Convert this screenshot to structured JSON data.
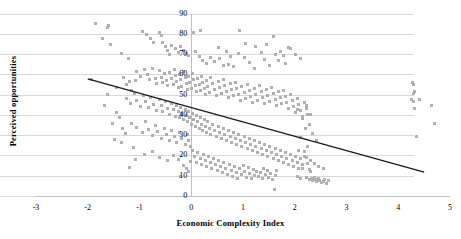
{
  "chart_data": {
    "type": "scatter",
    "title": "",
    "xlabel": "Economic Complexity Index",
    "ylabel": "Perceived opportunities",
    "xlim": [
      -3,
      5
    ],
    "ylim": [
      0,
      90
    ],
    "xticks": [
      "-3",
      "-2",
      "-1",
      "0",
      "1",
      "2",
      "3",
      "4",
      "5"
    ],
    "xtick_values": [
      -3,
      -2,
      -1,
      0,
      1,
      2,
      3,
      4,
      5
    ],
    "yticks": [
      "0",
      "10",
      "20",
      "30",
      "40",
      "50",
      "60",
      "70",
      "80",
      "90"
    ],
    "ytick_values": [
      0,
      10,
      20,
      30,
      40,
      50,
      60,
      70,
      80,
      90
    ],
    "grid": "horizontal",
    "legend": "none",
    "marker": {
      "shape": "square",
      "color": "#b0b0b0",
      "size_px": 3
    },
    "trendline": {
      "type": "linear",
      "color": "#1a1a1a",
      "width_px": 1.4,
      "x_start": -2.0,
      "y_start": 58.0,
      "x_end": 4.5,
      "y_end": 12.0
    },
    "points": [
      [
        -1.85,
        85.0
      ],
      [
        -1.6,
        84.0
      ],
      [
        -1.62,
        83.0
      ],
      [
        -1.72,
        77.5
      ],
      [
        -1.56,
        74.5
      ],
      [
        -1.35,
        70.5
      ],
      [
        -1.22,
        68.0
      ],
      [
        -0.95,
        81.0
      ],
      [
        -0.86,
        79.5
      ],
      [
        -0.78,
        77.5
      ],
      [
        -0.72,
        75.5
      ],
      [
        -0.62,
        80.5
      ],
      [
        -0.58,
        79.0
      ],
      [
        -0.55,
        75.5
      ],
      [
        -0.5,
        73.5
      ],
      [
        -0.45,
        72.0
      ],
      [
        -0.42,
        70.0
      ],
      [
        -0.38,
        74.0
      ],
      [
        -0.3,
        72.5
      ],
      [
        -0.25,
        71.0
      ],
      [
        -0.2,
        73.5
      ],
      [
        -0.15,
        72.0
      ],
      [
        -0.1,
        70.5
      ],
      [
        -0.05,
        69.5
      ],
      [
        0.05,
        80.5
      ],
      [
        0.18,
        81.5
      ],
      [
        0.08,
        71.5
      ],
      [
        0.15,
        69.0
      ],
      [
        0.22,
        67.0
      ],
      [
        0.3,
        65.5
      ],
      [
        0.45,
        66.5
      ],
      [
        0.55,
        68.0
      ],
      [
        0.62,
        64.5
      ],
      [
        0.72,
        65.0
      ],
      [
        0.82,
        64.0
      ],
      [
        0.93,
        81.5
      ],
      [
        0.92,
        70.5
      ],
      [
        1.02,
        68.5
      ],
      [
        1.12,
        66.0
      ],
      [
        1.22,
        63.0
      ],
      [
        1.35,
        71.0
      ],
      [
        1.42,
        67.5
      ],
      [
        1.52,
        64.5
      ],
      [
        1.58,
        78.5
      ],
      [
        1.62,
        70.0
      ],
      [
        1.68,
        67.0
      ],
      [
        1.72,
        71.5
      ],
      [
        1.78,
        69.5
      ],
      [
        1.82,
        65.5
      ],
      [
        1.88,
        73.0
      ],
      [
        -1.3,
        58.5
      ],
      [
        -1.2,
        56.5
      ],
      [
        -1.05,
        61.5
      ],
      [
        -0.98,
        59.0
      ],
      [
        -0.9,
        62.5
      ],
      [
        -0.85,
        60.0
      ],
      [
        -0.8,
        57.5
      ],
      [
        -0.75,
        63.0
      ],
      [
        -0.7,
        58.0
      ],
      [
        -0.68,
        55.5
      ],
      [
        -0.62,
        62.0
      ],
      [
        -0.58,
        58.5
      ],
      [
        -0.55,
        56.0
      ],
      [
        -0.52,
        60.5
      ],
      [
        -0.48,
        57.0
      ],
      [
        -0.45,
        54.5
      ],
      [
        -0.42,
        61.0
      ],
      [
        -0.38,
        58.0
      ],
      [
        -0.35,
        55.0
      ],
      [
        -0.32,
        62.5
      ],
      [
        -0.3,
        59.5
      ],
      [
        -0.28,
        56.5
      ],
      [
        -0.25,
        53.5
      ],
      [
        -0.22,
        60.0
      ],
      [
        -0.2,
        57.5
      ],
      [
        -0.18,
        54.0
      ],
      [
        -0.15,
        61.5
      ],
      [
        -0.12,
        58.5
      ],
      [
        -0.1,
        55.5
      ],
      [
        -0.08,
        52.5
      ],
      [
        -0.05,
        59.0
      ],
      [
        -0.03,
        56.0
      ],
      [
        0.0,
        53.0
      ],
      [
        0.02,
        60.5
      ],
      [
        0.05,
        57.5
      ],
      [
        0.08,
        54.5
      ],
      [
        0.1,
        51.5
      ],
      [
        0.12,
        58.0
      ],
      [
        0.15,
        55.0
      ],
      [
        0.18,
        52.0
      ],
      [
        0.2,
        59.0
      ],
      [
        0.22,
        56.0
      ],
      [
        0.25,
        53.0
      ],
      [
        0.28,
        50.0
      ],
      [
        0.3,
        57.0
      ],
      [
        0.32,
        54.0
      ],
      [
        0.35,
        51.0
      ],
      [
        0.38,
        58.5
      ],
      [
        0.42,
        55.5
      ],
      [
        0.45,
        52.5
      ],
      [
        0.48,
        49.5
      ],
      [
        0.52,
        56.5
      ],
      [
        0.55,
        53.5
      ],
      [
        0.58,
        50.5
      ],
      [
        0.62,
        57.5
      ],
      [
        0.65,
        54.5
      ],
      [
        0.68,
        51.5
      ],
      [
        0.72,
        48.5
      ],
      [
        0.75,
        55.5
      ],
      [
        0.78,
        52.5
      ],
      [
        0.82,
        49.5
      ],
      [
        0.85,
        56.0
      ],
      [
        0.88,
        53.0
      ],
      [
        0.92,
        50.0
      ],
      [
        0.95,
        47.0
      ],
      [
        0.98,
        54.0
      ],
      [
        1.02,
        51.0
      ],
      [
        1.05,
        48.0
      ],
      [
        1.08,
        55.0
      ],
      [
        1.12,
        52.0
      ],
      [
        1.15,
        49.0
      ],
      [
        1.18,
        46.0
      ],
      [
        1.22,
        53.0
      ],
      [
        1.25,
        50.0
      ],
      [
        1.28,
        47.0
      ],
      [
        1.32,
        54.5
      ],
      [
        1.35,
        51.5
      ],
      [
        1.38,
        48.5
      ],
      [
        1.42,
        45.5
      ],
      [
        1.45,
        52.5
      ],
      [
        1.48,
        49.5
      ],
      [
        1.52,
        46.5
      ],
      [
        1.55,
        53.5
      ],
      [
        1.58,
        50.5
      ],
      [
        1.62,
        47.5
      ],
      [
        1.65,
        44.5
      ],
      [
        1.68,
        51.5
      ],
      [
        1.72,
        48.5
      ],
      [
        1.75,
        45.5
      ],
      [
        1.78,
        52.0
      ],
      [
        1.82,
        49.0
      ],
      [
        1.85,
        46.0
      ],
      [
        1.88,
        43.0
      ],
      [
        1.92,
        50.0
      ],
      [
        1.95,
        47.0
      ],
      [
        1.98,
        44.0
      ],
      [
        2.02,
        41.0
      ],
      [
        2.05,
        48.0
      ],
      [
        2.08,
        45.0
      ],
      [
        2.12,
        42.0
      ],
      [
        2.15,
        39.0
      ],
      [
        2.18,
        46.0
      ],
      [
        2.22,
        43.0
      ],
      [
        2.25,
        40.0
      ],
      [
        -1.25,
        48.0
      ],
      [
        -1.18,
        45.5
      ],
      [
        -1.1,
        50.5
      ],
      [
        -1.05,
        47.0
      ],
      [
        -0.98,
        44.0
      ],
      [
        -0.92,
        49.5
      ],
      [
        -0.88,
        46.5
      ],
      [
        -0.82,
        43.5
      ],
      [
        -0.78,
        48.5
      ],
      [
        -0.72,
        45.0
      ],
      [
        -0.68,
        42.0
      ],
      [
        -0.62,
        47.5
      ],
      [
        -0.58,
        44.5
      ],
      [
        -0.55,
        41.5
      ],
      [
        -0.5,
        46.5
      ],
      [
        -0.45,
        43.0
      ],
      [
        -0.42,
        40.0
      ],
      [
        -0.38,
        45.5
      ],
      [
        -0.35,
        42.5
      ],
      [
        -0.3,
        39.0
      ],
      [
        -0.28,
        44.5
      ],
      [
        -0.25,
        41.5
      ],
      [
        -0.22,
        38.5
      ],
      [
        -0.2,
        43.5
      ],
      [
        -0.18,
        40.5
      ],
      [
        -0.15,
        37.5
      ],
      [
        -0.12,
        42.5
      ],
      [
        -0.1,
        39.5
      ],
      [
        -0.08,
        36.5
      ],
      [
        -0.05,
        41.5
      ],
      [
        -0.03,
        38.5
      ],
      [
        0.0,
        35.5
      ],
      [
        0.02,
        40.5
      ],
      [
        0.05,
        37.5
      ],
      [
        0.08,
        34.5
      ],
      [
        0.1,
        39.5
      ],
      [
        0.12,
        36.5
      ],
      [
        0.15,
        33.5
      ],
      [
        0.18,
        38.5
      ],
      [
        0.2,
        35.5
      ],
      [
        0.22,
        32.5
      ],
      [
        0.25,
        37.5
      ],
      [
        0.28,
        34.5
      ],
      [
        0.3,
        31.5
      ],
      [
        0.32,
        36.5
      ],
      [
        0.35,
        33.5
      ],
      [
        0.38,
        30.5
      ],
      [
        0.42,
        35.5
      ],
      [
        0.45,
        32.5
      ],
      [
        0.48,
        29.5
      ],
      [
        0.52,
        34.5
      ],
      [
        0.55,
        31.5
      ],
      [
        0.58,
        28.5
      ],
      [
        0.62,
        33.5
      ],
      [
        0.65,
        30.5
      ],
      [
        0.68,
        27.5
      ],
      [
        0.72,
        32.5
      ],
      [
        0.75,
        29.5
      ],
      [
        0.78,
        26.5
      ],
      [
        0.82,
        31.5
      ],
      [
        0.85,
        28.5
      ],
      [
        0.88,
        25.5
      ],
      [
        0.92,
        30.5
      ],
      [
        0.95,
        27.5
      ],
      [
        0.98,
        24.5
      ],
      [
        1.02,
        29.5
      ],
      [
        1.05,
        26.5
      ],
      [
        1.08,
        23.5
      ],
      [
        1.12,
        28.5
      ],
      [
        1.15,
        25.5
      ],
      [
        1.18,
        22.5
      ],
      [
        1.22,
        27.5
      ],
      [
        1.25,
        24.5
      ],
      [
        1.28,
        21.5
      ],
      [
        1.32,
        26.5
      ],
      [
        1.35,
        23.5
      ],
      [
        1.38,
        20.5
      ],
      [
        1.42,
        25.5
      ],
      [
        1.45,
        22.5
      ],
      [
        1.48,
        19.5
      ],
      [
        1.52,
        24.5
      ],
      [
        1.55,
        21.5
      ],
      [
        1.58,
        18.5
      ],
      [
        1.62,
        23.5
      ],
      [
        1.65,
        20.5
      ],
      [
        1.68,
        17.5
      ],
      [
        1.72,
        22.5
      ],
      [
        1.75,
        19.5
      ],
      [
        1.78,
        16.5
      ],
      [
        1.82,
        21.5
      ],
      [
        1.85,
        18.5
      ],
      [
        1.88,
        15.5
      ],
      [
        1.92,
        20.5
      ],
      [
        1.95,
        17.5
      ],
      [
        1.98,
        14.5
      ],
      [
        2.02,
        19.5
      ],
      [
        2.05,
        16.5
      ],
      [
        2.08,
        13.5
      ],
      [
        2.12,
        18.5
      ],
      [
        2.15,
        15.5
      ],
      [
        2.18,
        22.0
      ],
      [
        2.22,
        19.0
      ],
      [
        2.25,
        16.0
      ],
      [
        2.28,
        13.0
      ],
      [
        -1.32,
        33.5
      ],
      [
        -1.28,
        31.0
      ],
      [
        -1.15,
        36.0
      ],
      [
        -1.12,
        24.0
      ],
      [
        -1.05,
        34.0
      ],
      [
        -0.95,
        31.5
      ],
      [
        -0.88,
        36.5
      ],
      [
        -0.82,
        33.0
      ],
      [
        -0.75,
        30.0
      ],
      [
        -0.7,
        35.0
      ],
      [
        -0.65,
        32.0
      ],
      [
        -0.58,
        28.5
      ],
      [
        -0.52,
        33.5
      ],
      [
        -0.48,
        30.5
      ],
      [
        -0.42,
        27.5
      ],
      [
        -0.38,
        32.5
      ],
      [
        -0.32,
        29.5
      ],
      [
        -0.28,
        26.5
      ],
      [
        -0.22,
        31.5
      ],
      [
        -0.18,
        28.5
      ],
      [
        -0.12,
        25.5
      ],
      [
        -0.08,
        30.5
      ],
      [
        -0.05,
        27.5
      ],
      [
        -0.02,
        24.5
      ],
      [
        0.03,
        22.5
      ],
      [
        0.07,
        19.5
      ],
      [
        0.1,
        16.5
      ],
      [
        0.13,
        21.5
      ],
      [
        0.17,
        18.5
      ],
      [
        0.2,
        15.5
      ],
      [
        0.23,
        20.5
      ],
      [
        0.27,
        17.5
      ],
      [
        0.3,
        14.5
      ],
      [
        0.33,
        19.5
      ],
      [
        0.37,
        16.5
      ],
      [
        0.4,
        13.5
      ],
      [
        0.43,
        18.5
      ],
      [
        0.47,
        15.5
      ],
      [
        0.5,
        12.5
      ],
      [
        0.53,
        17.5
      ],
      [
        0.57,
        14.5
      ],
      [
        0.6,
        11.5
      ],
      [
        0.63,
        16.5
      ],
      [
        0.67,
        13.5
      ],
      [
        0.7,
        10.5
      ],
      [
        0.73,
        15.5
      ],
      [
        0.77,
        12.5
      ],
      [
        0.8,
        9.5
      ],
      [
        0.83,
        14.5
      ],
      [
        0.87,
        11.5
      ],
      [
        0.9,
        8.5
      ],
      [
        0.93,
        13.5
      ],
      [
        0.97,
        10.5
      ],
      [
        1.0,
        15.0
      ],
      [
        1.03,
        12.0
      ],
      [
        1.07,
        9.0
      ],
      [
        1.1,
        14.0
      ],
      [
        1.13,
        11.0
      ],
      [
        1.17,
        8.5
      ],
      [
        1.2,
        13.0
      ],
      [
        1.23,
        10.0
      ],
      [
        1.27,
        12.0
      ],
      [
        1.3,
        9.5
      ],
      [
        1.33,
        11.5
      ],
      [
        1.37,
        8.5
      ],
      [
        1.4,
        13.5
      ],
      [
        1.43,
        10.5
      ],
      [
        1.47,
        12.5
      ],
      [
        1.5,
        9.0
      ],
      [
        1.53,
        11.0
      ],
      [
        1.57,
        8.0
      ],
      [
        1.6,
        3.0
      ],
      [
        1.62,
        10.0
      ],
      [
        1.65,
        12.5
      ],
      [
        -0.75,
        22.0
      ],
      [
        -0.9,
        20.5
      ],
      [
        -1.08,
        18.0
      ],
      [
        -1.2,
        14.0
      ],
      [
        -0.62,
        19.0
      ],
      [
        -0.45,
        17.5
      ],
      [
        -0.35,
        20.0
      ],
      [
        -0.25,
        18.0
      ],
      [
        -0.15,
        15.0
      ],
      [
        -0.1,
        13.5
      ],
      [
        -0.05,
        12.0
      ],
      [
        -0.02,
        17.0
      ],
      [
        -0.2,
        9.5
      ],
      [
        2.05,
        9.5
      ],
      [
        2.12,
        8.5
      ],
      [
        2.22,
        9.0
      ],
      [
        2.28,
        8.0
      ],
      [
        2.32,
        8.5
      ],
      [
        2.35,
        7.5
      ],
      [
        2.38,
        9.0
      ],
      [
        2.4,
        8.0
      ],
      [
        2.42,
        7.0
      ],
      [
        2.45,
        8.5
      ],
      [
        2.48,
        7.5
      ],
      [
        2.52,
        6.5
      ],
      [
        2.55,
        7.0
      ],
      [
        2.58,
        8.0
      ],
      [
        2.62,
        6.0
      ],
      [
        2.65,
        7.5
      ],
      [
        2.15,
        13.5
      ],
      [
        2.3,
        12.0
      ],
      [
        2.45,
        14.5
      ],
      [
        2.55,
        13.5
      ],
      [
        2.08,
        22.5
      ],
      [
        2.18,
        19.5
      ],
      [
        2.25,
        24.5
      ],
      [
        2.3,
        17.5
      ],
      [
        2.38,
        16.0
      ],
      [
        2.12,
        29.0
      ],
      [
        2.2,
        33.5
      ],
      [
        2.28,
        35.5
      ],
      [
        2.35,
        31.0
      ],
      [
        2.42,
        27.5
      ],
      [
        2.05,
        42.5
      ],
      [
        2.15,
        38.0
      ],
      [
        2.22,
        44.5
      ],
      [
        2.3,
        40.0
      ],
      [
        4.28,
        56.0
      ],
      [
        4.3,
        55.0
      ],
      [
        4.3,
        50.5
      ],
      [
        4.32,
        51.5
      ],
      [
        4.25,
        47.5
      ],
      [
        4.3,
        46.5
      ],
      [
        4.42,
        47.5
      ],
      [
        4.32,
        43.0
      ],
      [
        4.65,
        44.5
      ],
      [
        4.7,
        36.0
      ],
      [
        4.35,
        29.5
      ],
      [
        -1.92,
        57.5
      ],
      [
        -1.68,
        44.5
      ],
      [
        -1.45,
        41.0
      ],
      [
        -1.38,
        38.5
      ],
      [
        -1.52,
        36.0
      ],
      [
        -1.48,
        28.0
      ],
      [
        -1.35,
        26.5
      ],
      [
        -1.62,
        50.0
      ],
      [
        -1.45,
        53.5
      ],
      [
        -1.25,
        55.0
      ],
      [
        -1.15,
        52.0
      ],
      [
        -1.08,
        57.0
      ],
      [
        0.38,
        68.5
      ],
      [
        0.52,
        73.0
      ],
      [
        0.68,
        71.5
      ],
      [
        0.75,
        69.0
      ],
      [
        1.05,
        75.0
      ],
      [
        1.25,
        73.5
      ],
      [
        1.45,
        74.5
      ],
      [
        1.92,
        72.5
      ],
      [
        2.02,
        70.0
      ],
      [
        2.12,
        68.0
      ]
    ]
  }
}
